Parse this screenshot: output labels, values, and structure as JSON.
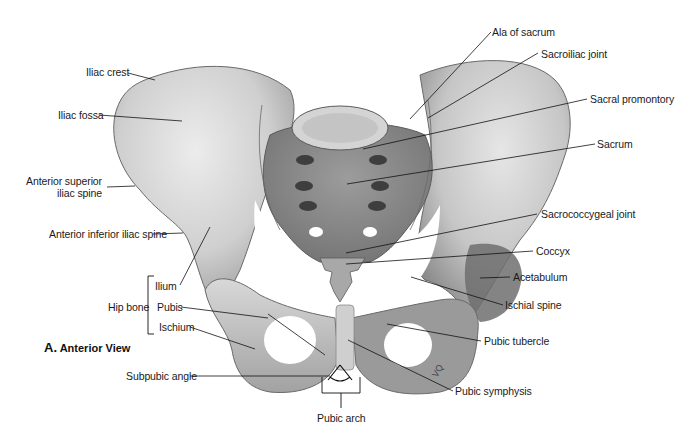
{
  "figure": {
    "caption_letter": "A.",
    "caption_text": "Anterior View",
    "palette": {
      "bone_light": "#e4e4e4",
      "bone_mid": "#bdbdbd",
      "bone_dark": "#7a7a7a",
      "sacrum": "#8e8e8e",
      "line": "#1a1a1a"
    }
  },
  "labels_left": {
    "iliac_crest": "Iliac crest",
    "iliac_fossa": "Iliac fossa",
    "asis_line1": "Anterior superior",
    "asis_line2": "iliac spine",
    "aiis": "Anterior inferior iliac spine",
    "hip_bone": "Hip bone",
    "ilium": "Ilium",
    "pubis": "Pubis",
    "ischium": "Ischium",
    "subpubic_angle": "Subpubic angle"
  },
  "labels_right": {
    "ala_of_sacrum": "Ala of sacrum",
    "sacroiliac_joint": "Sacroiliac joint",
    "sacral_promontory": "Sacral promontory",
    "sacrum": "Sacrum",
    "sacrococcygeal_joint": "Sacrococcygeal joint",
    "coccyx": "Coccyx",
    "acetabulum": "Acetabulum",
    "ischial_spine": "Ischial spine",
    "pubic_tubercle": "Pubic tubercle",
    "pubic_symphysis": "Pubic symphysis"
  },
  "labels_bottom": {
    "pubic_arch": "Pubic arch"
  },
  "artist_mark": "VQ"
}
